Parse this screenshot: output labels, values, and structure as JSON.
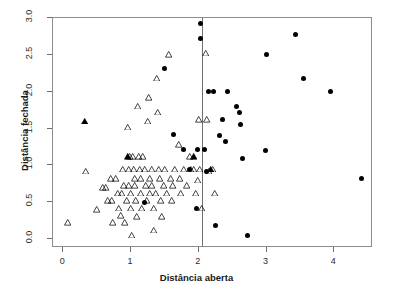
{
  "chart_data": {
    "type": "scatter",
    "title": "",
    "xlabel": "Distância aberta",
    "ylabel": "Distância fechada",
    "xlim": [
      -0.15,
      4.57
    ],
    "ylim": [
      -0.12,
      3.0
    ],
    "xticks": [
      0,
      1,
      2,
      3,
      4
    ],
    "xticklabels": [
      "0",
      "1",
      "2",
      "3",
      "4"
    ],
    "yticks": [
      0.0,
      0.5,
      1.0,
      1.5,
      2.0,
      2.5,
      3.0
    ],
    "yticklabels": [
      "0.0",
      "0.5",
      "1.0",
      "1.5",
      "2.0",
      "2.5",
      "3.0"
    ],
    "grid": false,
    "legend": null,
    "annotations": [
      {
        "name": "vertical-reference-line",
        "type": "vline",
        "x": 2.05,
        "color": "#6e6e6e"
      }
    ],
    "series": [
      {
        "name": "open-triangle",
        "marker": "triangle-open",
        "color": "#000000",
        "fill": "none",
        "points": [
          [
            0.06,
            0.22
          ],
          [
            0.33,
            0.92
          ],
          [
            0.5,
            0.4
          ],
          [
            0.58,
            0.7
          ],
          [
            0.63,
            0.7
          ],
          [
            0.66,
            0.52
          ],
          [
            0.7,
            0.82
          ],
          [
            0.72,
            0.52
          ],
          [
            0.73,
            0.22
          ],
          [
            0.78,
            0.82
          ],
          [
            0.8,
            0.62
          ],
          [
            0.82,
            0.42
          ],
          [
            0.85,
            0.32
          ],
          [
            0.86,
            0.62
          ],
          [
            0.88,
            0.95
          ],
          [
            0.9,
            0.72
          ],
          [
            0.91,
            0.22
          ],
          [
            0.93,
            0.52
          ],
          [
            0.95,
            1.52
          ],
          [
            0.96,
            0.95
          ],
          [
            0.97,
            0.72
          ],
          [
            0.98,
            1.12
          ],
          [
            0.99,
            0.62
          ],
          [
            1.0,
            0.42
          ],
          [
            1.01,
            0.05
          ],
          [
            1.03,
            1.12
          ],
          [
            1.04,
            0.95
          ],
          [
            1.05,
            0.82
          ],
          [
            1.06,
            0.72
          ],
          [
            1.07,
            0.52
          ],
          [
            1.08,
            0.3
          ],
          [
            1.1,
            1.8
          ],
          [
            1.12,
            1.12
          ],
          [
            1.13,
            0.95
          ],
          [
            1.14,
            0.82
          ],
          [
            1.15,
            0.62
          ],
          [
            1.16,
            0.42
          ],
          [
            1.18,
            1.12
          ],
          [
            1.2,
            0.95
          ],
          [
            1.21,
            0.72
          ],
          [
            1.23,
            0.52
          ],
          [
            1.25,
            1.6
          ],
          [
            1.26,
            1.92
          ],
          [
            1.27,
            0.82
          ],
          [
            1.28,
            0.62
          ],
          [
            1.3,
            0.95
          ],
          [
            1.31,
            0.72
          ],
          [
            1.33,
            0.42
          ],
          [
            1.34,
            0.12
          ],
          [
            1.36,
            0.62
          ],
          [
            1.38,
            2.18
          ],
          [
            1.4,
            1.72
          ],
          [
            1.41,
            0.95
          ],
          [
            1.42,
            0.82
          ],
          [
            1.44,
            0.52
          ],
          [
            1.45,
            0.3
          ],
          [
            1.48,
            0.72
          ],
          [
            1.5,
            0.95
          ],
          [
            1.52,
            0.62
          ],
          [
            1.55,
            2.5
          ],
          [
            1.58,
            0.82
          ],
          [
            1.6,
            0.52
          ],
          [
            1.62,
            0.72
          ],
          [
            1.65,
            0.95
          ],
          [
            1.7,
            1.28
          ],
          [
            1.72,
            0.82
          ],
          [
            1.74,
            0.62
          ],
          [
            1.78,
            0.95
          ],
          [
            1.82,
            0.72
          ],
          [
            1.86,
            1.12
          ],
          [
            1.88,
            0.95
          ],
          [
            1.92,
            0.95
          ],
          [
            1.95,
            0.62
          ],
          [
            1.98,
            0.8
          ],
          [
            2.0,
            1.62
          ],
          [
            2.02,
            0.95
          ],
          [
            2.04,
            0.42
          ],
          [
            2.1,
            2.52
          ],
          [
            2.12,
            1.62
          ],
          [
            2.14,
            0.92
          ],
          [
            2.2,
            0.95
          ],
          [
            2.24,
            0.62
          ]
        ]
      },
      {
        "name": "filled-triangle",
        "marker": "triangle-filled",
        "color": "#000000",
        "fill": "#000000",
        "points": [
          [
            0.32,
            1.6
          ],
          [
            0.95,
            1.12
          ],
          [
            1.92,
            1.12
          ],
          [
            2.18,
            0.95
          ]
        ]
      },
      {
        "name": "filled-circle",
        "marker": "circle-filled",
        "color": "#000000",
        "fill": "#000000",
        "points": [
          [
            1.2,
            0.5
          ],
          [
            1.5,
            2.32
          ],
          [
            1.62,
            1.42
          ],
          [
            1.78,
            1.22
          ],
          [
            1.86,
            0.95
          ],
          [
            1.96,
            0.42
          ],
          [
            1.98,
            1.22
          ],
          [
            2.02,
            2.92
          ],
          [
            2.02,
            2.72
          ],
          [
            2.08,
            1.22
          ],
          [
            2.12,
            0.92
          ],
          [
            2.15,
            2.0
          ],
          [
            2.22,
            2.0
          ],
          [
            2.25,
            0.18
          ],
          [
            2.3,
            1.4
          ],
          [
            2.35,
            1.62
          ],
          [
            2.4,
            1.32
          ],
          [
            2.42,
            2.0
          ],
          [
            2.55,
            1.8
          ],
          [
            2.6,
            1.72
          ],
          [
            2.62,
            1.55
          ],
          [
            2.65,
            1.1
          ],
          [
            2.72,
            0.05
          ],
          [
            2.98,
            1.2
          ],
          [
            3.0,
            2.5
          ],
          [
            3.42,
            2.78
          ],
          [
            3.55,
            2.18
          ],
          [
            3.95,
            2.0
          ],
          [
            4.4,
            0.82
          ]
        ]
      }
    ]
  }
}
